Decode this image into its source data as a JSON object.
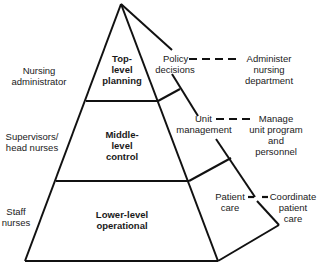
{
  "diagram": {
    "type": "pyramid",
    "roles": [
      {
        "line1": "Nursing",
        "line2": "administrator"
      },
      {
        "line1": "Supervisors/",
        "line2": "head nurses"
      },
      {
        "line1": "Staff",
        "line2": "nurses"
      }
    ],
    "levels": [
      {
        "line1": "Top-",
        "line2": "level",
        "line3": "planning"
      },
      {
        "line1": "Middle-",
        "line2": "level",
        "line3": "control"
      },
      {
        "line1": "Lower-level",
        "line2": "operational"
      }
    ],
    "functions": [
      {
        "line1": "Policy",
        "line2": "decisions"
      },
      {
        "line1": "Unit",
        "line2": "management"
      },
      {
        "line1": "Patient",
        "line2": "care"
      }
    ],
    "responsibilities": [
      {
        "line1": "Administer",
        "line2": "nursing",
        "line3": "department"
      },
      {
        "line1": "Manage",
        "line2": "unit program",
        "line3": "and",
        "line4": "personnel"
      },
      {
        "line1": "Coordinate",
        "line2": "patient",
        "line3": "care"
      }
    ],
    "colors": {
      "line": "#111111",
      "text": "#1a1a1a",
      "background": "#ffffff"
    }
  }
}
